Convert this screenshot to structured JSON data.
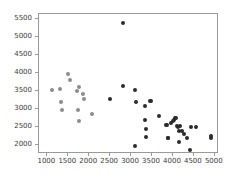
{
  "chart_data": {
    "type": "scatter",
    "title": "",
    "subtitle": "",
    "xlabel": "",
    "ylabel": "",
    "xlim": [
      800,
      5100
    ],
    "ylim": [
      1750,
      5650
    ],
    "grid": false,
    "legend": null,
    "xticks": [
      1000,
      1500,
      2000,
      2500,
      3000,
      3500,
      4000,
      4500,
      5000
    ],
    "xtick_labels": [
      "1000",
      "1500",
      "2000",
      "2500",
      "3000",
      "3500",
      "4000",
      "4500",
      "5000"
    ],
    "yticks": [
      2000,
      2500,
      3000,
      3500,
      4000,
      4500,
      5000,
      5500
    ],
    "ytick_labels": [
      "2000",
      "2500",
      "3000",
      "3500",
      "4000",
      "4500",
      "5000",
      "5500"
    ],
    "marker": "circle",
    "marker_size_px": 4,
    "series": [
      {
        "name": "light-group",
        "color": "#8c8c8c",
        "points": [
          [
            1100,
            3520
          ],
          [
            1310,
            3550
          ],
          [
            1330,
            3195
          ],
          [
            1340,
            2985
          ],
          [
            1490,
            3965
          ],
          [
            1540,
            3805
          ],
          [
            1700,
            3495
          ],
          [
            1740,
            2985
          ],
          [
            1760,
            3610
          ],
          [
            1760,
            2675
          ],
          [
            1840,
            3430
          ],
          [
            1870,
            3275
          ],
          [
            2070,
            2860
          ]
        ]
      },
      {
        "name": "dark-group",
        "color": "#2b2b2b",
        "points": [
          [
            2490,
            3280
          ],
          [
            2800,
            5400
          ],
          [
            2810,
            3650
          ],
          [
            3100,
            3530
          ],
          [
            3105,
            1980
          ],
          [
            3110,
            3200
          ],
          [
            3330,
            3090
          ],
          [
            3340,
            2690
          ],
          [
            3350,
            2440
          ],
          [
            3355,
            2235
          ],
          [
            3440,
            3230
          ],
          [
            3470,
            3215
          ],
          [
            3660,
            2805
          ],
          [
            3830,
            2560
          ],
          [
            3860,
            2545
          ],
          [
            3870,
            2195
          ],
          [
            3890,
            2190
          ],
          [
            3950,
            2620
          ],
          [
            3990,
            2660
          ],
          [
            4030,
            2700
          ],
          [
            4060,
            2740
          ],
          [
            4080,
            2755
          ],
          [
            4095,
            2530
          ],
          [
            4110,
            2515
          ],
          [
            4140,
            2400
          ],
          [
            4150,
            2075
          ],
          [
            4180,
            2520
          ],
          [
            4220,
            2390
          ],
          [
            4260,
            2300
          ],
          [
            4330,
            2205
          ],
          [
            4400,
            1865
          ],
          [
            4430,
            2490
          ],
          [
            4560,
            2500
          ],
          [
            4900,
            2245
          ],
          [
            4905,
            2200
          ]
        ]
      }
    ]
  },
  "figure": {
    "background_color": "#ffffff",
    "axes_color": "#9a9a9a",
    "tick_label_color": "#3b3b3b"
  }
}
